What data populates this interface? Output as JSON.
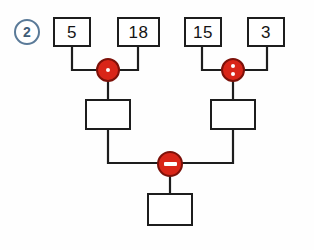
{
  "exercise": {
    "number": "2",
    "type": "operation-tree"
  },
  "colors": {
    "node_fill": "#d92518",
    "node_stroke": "#7d1109",
    "wire": "#1d1d1d",
    "box_stroke": "#1d1d1d",
    "badge_stroke": "#5a7a98",
    "badge_text": "#3f5c77",
    "background": "#fefefe"
  },
  "nodes": {
    "input_1": {
      "label": "operand-5",
      "value": "5"
    },
    "input_2": {
      "label": "operand-18",
      "value": "18"
    },
    "input_3": {
      "label": "operand-15",
      "value": "15"
    },
    "input_4": {
      "label": "operand-3",
      "value": "3"
    },
    "mid_left": {
      "label": "intermediate-result-left",
      "value": ""
    },
    "mid_right": {
      "label": "intermediate-result-right",
      "value": ""
    },
    "result": {
      "label": "final-result",
      "value": ""
    }
  },
  "operators": {
    "left": {
      "symbol": "·",
      "name": "multiply",
      "dots": 1
    },
    "right": {
      "symbol": ":",
      "name": "divide",
      "dots": 2
    },
    "bottom": {
      "symbol": "−",
      "name": "subtract",
      "dots": 0
    }
  }
}
